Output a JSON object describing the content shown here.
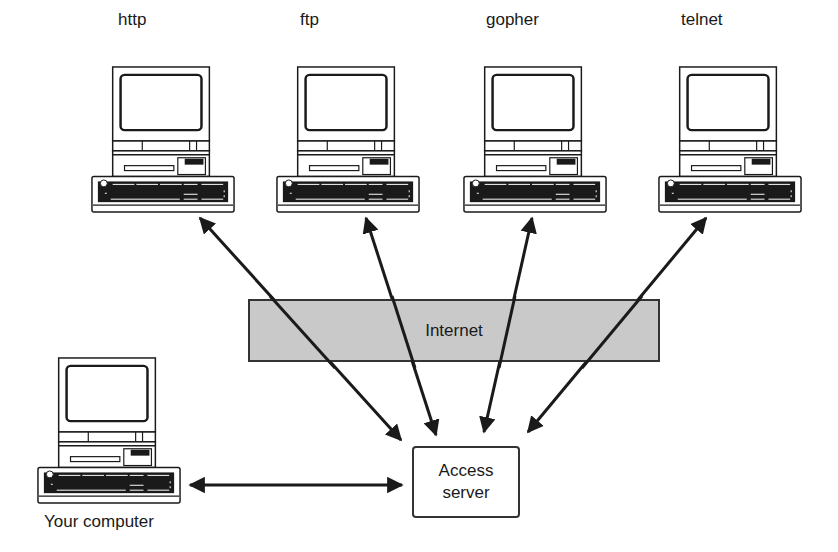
{
  "servers": [
    {
      "label": "http",
      "x": 90,
      "label_x": 118
    },
    {
      "label": "ftp",
      "x": 275,
      "label_x": 300
    },
    {
      "label": "gopher",
      "x": 462,
      "label_x": 486
    },
    {
      "label": "telnet",
      "x": 657,
      "label_x": 681
    }
  ],
  "internet": {
    "label": "Internet",
    "fill": "#c9c9c9"
  },
  "access_server": {
    "line1": "Access",
    "line2": "server"
  },
  "your_computer": {
    "label": "Your computer"
  },
  "arrows": [
    {
      "from": "http",
      "x1": 200,
      "y1": 218,
      "x2": 401,
      "y2": 440
    },
    {
      "from": "ftp",
      "x1": 366,
      "y1": 218,
      "x2": 436,
      "y2": 435
    },
    {
      "from": "gopher",
      "x1": 532,
      "y1": 218,
      "x2": 484,
      "y2": 432
    },
    {
      "from": "telnet",
      "x1": 706,
      "y1": 218,
      "x2": 528,
      "y2": 432
    },
    {
      "from": "your-computer",
      "x1": 190,
      "y1": 485,
      "x2": 402,
      "y2": 485
    }
  ],
  "colors": {
    "stroke": "#1a1a1a",
    "internet_fill": "#c9c9c9"
  }
}
